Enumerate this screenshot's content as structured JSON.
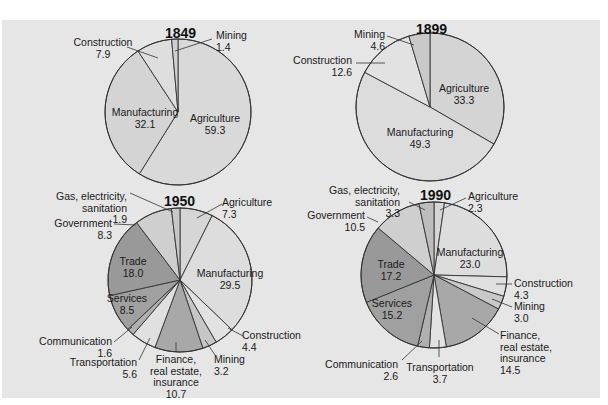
{
  "colors": {
    "background": "#e6e6e6",
    "slice_light": "#d9d9d9",
    "slice_lighter": "#e2e2e2",
    "slice_medium": "#c4c4c4",
    "slice_dark": "#a3a3a3",
    "slice_darker": "#959595",
    "stroke": "#333333"
  },
  "chart_data": [
    {
      "type": "pie",
      "title": "1849",
      "unit": "percent",
      "slices": [
        {
          "label": "Agriculture",
          "value": 59.3
        },
        {
          "label": "Manufacturing",
          "value": 32.1
        },
        {
          "label": "Construction",
          "value": 7.9
        },
        {
          "label": "Mining",
          "value": 1.4
        }
      ]
    },
    {
      "type": "pie",
      "title": "1899",
      "unit": "percent",
      "slices": [
        {
          "label": "Agriculture",
          "value": 33.3
        },
        {
          "label": "Manufacturing",
          "value": 49.3
        },
        {
          "label": "Construction",
          "value": 12.6
        },
        {
          "label": "Mining",
          "value": 4.6
        }
      ]
    },
    {
      "type": "pie",
      "title": "1950",
      "unit": "percent",
      "slices": [
        {
          "label": "Agriculture",
          "value": 7.3
        },
        {
          "label": "Manufacturing",
          "value": 29.5
        },
        {
          "label": "Construction",
          "value": 4.4
        },
        {
          "label": "Mining",
          "value": 3.2
        },
        {
          "label": "Finance, real estate, insurance",
          "value": 10.7
        },
        {
          "label": "Transportation",
          "value": 5.6
        },
        {
          "label": "Communication",
          "value": 1.6
        },
        {
          "label": "Services",
          "value": 8.5
        },
        {
          "label": "Trade",
          "value": 18.0
        },
        {
          "label": "Government",
          "value": 8.3
        },
        {
          "label": "Gas, electricity, sanitation",
          "value": 1.9
        }
      ]
    },
    {
      "type": "pie",
      "title": "1990",
      "unit": "percent",
      "slices": [
        {
          "label": "Agriculture",
          "value": 2.3
        },
        {
          "label": "Manufacturing",
          "value": 23.0
        },
        {
          "label": "Construction",
          "value": 4.3
        },
        {
          "label": "Mining",
          "value": 3.0
        },
        {
          "label": "Finance, real estate, insurance",
          "value": 14.5
        },
        {
          "label": "Transportation",
          "value": 3.7
        },
        {
          "label": "Communication",
          "value": 2.6
        },
        {
          "label": "Services",
          "value": 15.2
        },
        {
          "label": "Trade",
          "value": 17.2
        },
        {
          "label": "Government",
          "value": 10.5
        },
        {
          "label": "Gas, electricity, sanitation",
          "value": 3.3
        }
      ]
    }
  ],
  "pies": [
    {
      "year": "1849",
      "cx": 178,
      "cy": 112,
      "r": 73,
      "title_pos": [
        165,
        38
      ],
      "slices": [
        {
          "value": 59.3,
          "fill": "#d9d9d9"
        },
        {
          "value": 32.1,
          "fill": "#d4d4d4"
        },
        {
          "value": 7.9,
          "fill": "#dedede"
        },
        {
          "value": 1.4,
          "fill": "#d0d0d0"
        }
      ],
      "labels": [
        {
          "lines": [
            "Agriculture",
            "59.3"
          ],
          "x": 215,
          "y": 122,
          "anchor": "middle"
        },
        {
          "lines": [
            "Manufacturing",
            "32.1"
          ],
          "x": 145,
          "y": 116,
          "anchor": "middle"
        },
        {
          "lines": [
            "Construction",
            "7.9"
          ],
          "x": 103,
          "y": 46,
          "anchor": "middle"
        },
        {
          "lines": [
            "Mining",
            "1.4"
          ],
          "x": 216,
          "y": 39,
          "anchor": "start"
        }
      ],
      "leaders": [
        [
          127,
          47,
          158,
          58
        ],
        [
          212,
          39,
          175,
          51
        ]
      ]
    },
    {
      "year": "1899",
      "cx": 430,
      "cy": 107,
      "r": 74,
      "title_pos": [
        416,
        34
      ],
      "slices": [
        {
          "value": 33.3,
          "fill": "#d4d4d4"
        },
        {
          "value": 49.3,
          "fill": "#dcdcdc"
        },
        {
          "value": 12.6,
          "fill": "#e2e2e2"
        },
        {
          "value": 4.6,
          "fill": "#c9c9c9"
        }
      ],
      "labels": [
        {
          "lines": [
            "Agriculture",
            "33.3"
          ],
          "x": 464,
          "y": 92,
          "anchor": "middle"
        },
        {
          "lines": [
            "Manufacturing",
            "49.3"
          ],
          "x": 420,
          "y": 136,
          "anchor": "middle"
        },
        {
          "lines": [
            "Construction",
            "12.6"
          ],
          "x": 352,
          "y": 64,
          "anchor": "end"
        },
        {
          "lines": [
            "Mining",
            "4.6"
          ],
          "x": 385,
          "y": 38,
          "anchor": "end"
        }
      ],
      "leaders": [
        [
          356,
          63,
          385,
          63
        ],
        [
          387,
          36,
          414,
          45
        ]
      ]
    },
    {
      "year": "1950",
      "cx": 180,
      "cy": 280,
      "r": 72,
      "title_pos": [
        164,
        206
      ],
      "slices": [
        {
          "value": 7.3,
          "fill": "#d6d6d6"
        },
        {
          "value": 29.5,
          "fill": "#dddddd"
        },
        {
          "value": 4.4,
          "fill": "#e2e2e2"
        },
        {
          "value": 3.2,
          "fill": "#c6c6c6"
        },
        {
          "value": 10.7,
          "fill": "#a8a8a8"
        },
        {
          "value": 5.6,
          "fill": "#e0e0e0"
        },
        {
          "value": 1.6,
          "fill": "#b0b0b0"
        },
        {
          "value": 8.5,
          "fill": "#a0a0a0"
        },
        {
          "value": 18.0,
          "fill": "#999999"
        },
        {
          "value": 8.3,
          "fill": "#cfcfcf"
        },
        {
          "value": 1.9,
          "fill": "#c8c8c8"
        }
      ]
    },
    {
      "year": "1990",
      "cx": 434,
      "cy": 275,
      "r": 73,
      "title_pos": [
        420,
        200
      ],
      "slices": [
        {
          "value": 2.3,
          "fill": "#d6d6d6"
        },
        {
          "value": 23.0,
          "fill": "#dddddd"
        },
        {
          "value": 4.3,
          "fill": "#e0e0e0"
        },
        {
          "value": 3.0,
          "fill": "#c9c9c9"
        },
        {
          "value": 14.5,
          "fill": "#a8a8a8"
        },
        {
          "value": 3.7,
          "fill": "#e2e2e2"
        },
        {
          "value": 2.6,
          "fill": "#b0b0b0"
        },
        {
          "value": 15.2,
          "fill": "#a0a0a0"
        },
        {
          "value": 17.2,
          "fill": "#999999"
        },
        {
          "value": 10.5,
          "fill": "#cfcfcf"
        },
        {
          "value": 3.3,
          "fill": "#bdbdbd"
        }
      ]
    }
  ],
  "labels_1950": [
    {
      "lines": [
        "Agriculture",
        "7.3"
      ],
      "x": 222,
      "y": 206,
      "anchor": "start"
    },
    {
      "lines": [
        "Manufacturing",
        "29.5"
      ],
      "x": 230,
      "y": 277,
      "anchor": "middle"
    },
    {
      "lines": [
        "Construction",
        "4.4"
      ],
      "x": 242,
      "y": 339,
      "anchor": "start"
    },
    {
      "lines": [
        "Mining",
        "3.2"
      ],
      "x": 214,
      "y": 363,
      "anchor": "start"
    },
    {
      "lines": [
        "Finance,",
        "real estate,",
        "insurance",
        "10.7"
      ],
      "x": 176,
      "y": 363,
      "anchor": "middle"
    },
    {
      "lines": [
        "Transportation",
        "5.6"
      ],
      "x": 137,
      "y": 366,
      "anchor": "end"
    },
    {
      "lines": [
        "Communication",
        "1.6"
      ],
      "x": 112,
      "y": 345,
      "anchor": "end"
    },
    {
      "lines": [
        "Services",
        "8.5"
      ],
      "x": 127,
      "y": 302,
      "anchor": "middle"
    },
    {
      "lines": [
        "Trade",
        "18.0"
      ],
      "x": 133,
      "y": 265,
      "anchor": "middle"
    },
    {
      "lines": [
        "Government",
        "8.3"
      ],
      "x": 112,
      "y": 227,
      "anchor": "end"
    },
    {
      "lines": [
        "Gas, electricity,",
        "sanitation",
        "1.9"
      ],
      "x": 127,
      "y": 200,
      "anchor": "end"
    }
  ],
  "leaders_1950": [
    [
      222,
      204,
      197,
      218
    ],
    [
      243,
      336,
      228,
      328
    ],
    [
      215,
      355,
      205,
      340
    ],
    [
      176,
      352,
      176,
      342
    ],
    [
      139,
      360,
      150,
      338
    ],
    [
      114,
      342,
      132,
      327
    ],
    [
      114,
      224,
      136,
      225
    ],
    [
      130,
      193,
      173,
      212
    ]
  ],
  "labels_1990": [
    {
      "lines": [
        "Agriculture",
        "2.3"
      ],
      "x": 468,
      "y": 200,
      "anchor": "start"
    },
    {
      "lines": [
        "Manufacturing",
        "23.0"
      ],
      "x": 470,
      "y": 256,
      "anchor": "middle"
    },
    {
      "lines": [
        "Construction",
        "4.3"
      ],
      "x": 514,
      "y": 287,
      "anchor": "start"
    },
    {
      "lines": [
        "Mining",
        "3.0"
      ],
      "x": 514,
      "y": 310,
      "anchor": "start"
    },
    {
      "lines": [
        "Finance,",
        "real estate,",
        "insurance",
        "14.5"
      ],
      "x": 500,
      "y": 339,
      "anchor": "start"
    },
    {
      "lines": [
        "Transportation",
        "3.7"
      ],
      "x": 440,
      "y": 371,
      "anchor": "middle"
    },
    {
      "lines": [
        "Communication",
        "2.6"
      ],
      "x": 398,
      "y": 368,
      "anchor": "end"
    },
    {
      "lines": [
        "Services",
        "15.2"
      ],
      "x": 392,
      "y": 307,
      "anchor": "middle"
    },
    {
      "lines": [
        "Trade",
        "17.2"
      ],
      "x": 391,
      "y": 268,
      "anchor": "middle"
    },
    {
      "lines": [
        "Government",
        "10.5"
      ],
      "x": 365,
      "y": 219,
      "anchor": "end"
    },
    {
      "lines": [
        "Gas, electricity,",
        "sanitation",
        "3.3"
      ],
      "x": 400,
      "y": 194,
      "anchor": "end"
    }
  ],
  "leaders_1990": [
    [
      466,
      198,
      440,
      210
    ],
    [
      512,
      284,
      496,
      284
    ],
    [
      512,
      307,
      492,
      299
    ],
    [
      499,
      334,
      472,
      318
    ],
    [
      439,
      357,
      439,
      340
    ],
    [
      402,
      360,
      422,
      341
    ],
    [
      367,
      217,
      378,
      222
    ],
    [
      409,
      202,
      425,
      210
    ]
  ]
}
